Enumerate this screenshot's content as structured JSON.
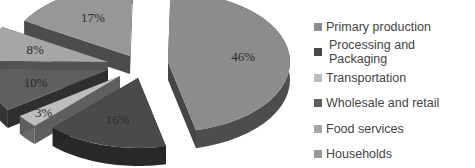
{
  "chart_data": {
    "type": "pie",
    "style": "3d-exploded",
    "title": "",
    "categories": [
      "Primary production",
      "Processing and Packaging",
      "Transportation",
      "Wholesale and retail",
      "Food services",
      "Households"
    ],
    "values": [
      46,
      16,
      3,
      10,
      8,
      17
    ],
    "labels": [
      "46%",
      "16%",
      "3%",
      "10%",
      "8%",
      "17%"
    ],
    "colors": [
      "#8c8c8c",
      "#4a4a4a",
      "#bdbdbd",
      "#5e5e5e",
      "#a6a6a6",
      "#979797"
    ],
    "legend_position": "right"
  }
}
